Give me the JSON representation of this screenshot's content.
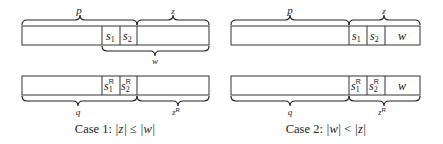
{
  "diagram": {
    "cases": [
      {
        "id": "case1",
        "caption": "Case 1: |z| ≤ |w|",
        "caption_parts": {
          "prefix": "Case 1: ",
          "lhs": "|z|",
          "rel": " ≤ ",
          "rhs": "|w|"
        },
        "top_row": {
          "cells": [
            {
              "label": "",
              "role": "prefix"
            },
            {
              "label": "s",
              "sub": "1"
            },
            {
              "label": "s",
              "sub": "2"
            },
            {
              "label": "",
              "role": "rest"
            }
          ],
          "braces_above": [
            {
              "label": "p"
            },
            {
              "label": "z"
            }
          ],
          "braces_below": [
            {
              "label": "w"
            }
          ]
        },
        "bottom_row": {
          "cells": [
            {
              "label": "",
              "role": "prefix"
            },
            {
              "label": "s",
              "sub": "1",
              "sup": "R"
            },
            {
              "label": "s",
              "sub": "2",
              "sup": "R"
            },
            {
              "label": "",
              "role": "rest"
            }
          ],
          "braces_below": [
            {
              "label": "q"
            },
            {
              "label": "z",
              "sup": "R"
            }
          ]
        }
      },
      {
        "id": "case2",
        "caption": "Case 2: |w| < |z|",
        "caption_parts": {
          "prefix": "Case 2: ",
          "lhs": "|w|",
          "rel": " < ",
          "rhs": "|z|"
        },
        "top_row": {
          "cells": [
            {
              "label": "",
              "role": "prefix"
            },
            {
              "label": "s",
              "sub": "1"
            },
            {
              "label": "s",
              "sub": "2"
            },
            {
              "label": "w"
            }
          ],
          "braces_above": [
            {
              "label": "p"
            },
            {
              "label": "z"
            }
          ]
        },
        "bottom_row": {
          "cells": [
            {
              "label": "",
              "role": "prefix"
            },
            {
              "label": "s",
              "sub": "1",
              "sup": "R"
            },
            {
              "label": "s",
              "sub": "2",
              "sup": "R"
            },
            {
              "label": "w"
            }
          ],
          "braces_below": [
            {
              "label": "q"
            },
            {
              "label": "z",
              "sup": "R"
            }
          ]
        }
      }
    ]
  }
}
